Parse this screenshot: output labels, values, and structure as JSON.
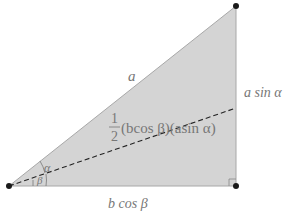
{
  "diagram": {
    "type": "right-triangle",
    "fill_color": "#d4d4d4",
    "edge_color": "#9a9a9a",
    "dash_color": "#222222",
    "vertex_color": "#1a1a1a",
    "labels": {
      "hypotenuse": "a",
      "vertical_side": "a sin α",
      "base": "b cos β",
      "area_fraction_num": "1",
      "area_fraction_den": "2",
      "area_expr": "(bcos β)(asin α)",
      "angle_alpha": "α",
      "angle_beta": "β"
    }
  }
}
